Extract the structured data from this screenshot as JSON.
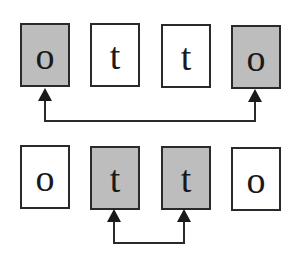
{
  "diagram": {
    "colors": {
      "shaded_fill": "#bdbdbd",
      "plain_fill": "#ffffff",
      "stroke": "#2a2a2a"
    },
    "rows": [
      {
        "tiles": [
          {
            "letter": "o",
            "shaded": true
          },
          {
            "letter": "t",
            "shaded": false
          },
          {
            "letter": "t",
            "shaded": false
          },
          {
            "letter": "o",
            "shaded": true
          }
        ],
        "connector": {
          "from_tile": 0,
          "to_tile": 3,
          "arrowheads": "both-up"
        }
      },
      {
        "tiles": [
          {
            "letter": "o",
            "shaded": false
          },
          {
            "letter": "t",
            "shaded": true
          },
          {
            "letter": "t",
            "shaded": true
          },
          {
            "letter": "o",
            "shaded": false
          }
        ],
        "connector": {
          "from_tile": 1,
          "to_tile": 2,
          "arrowheads": "both-up"
        }
      }
    ]
  }
}
